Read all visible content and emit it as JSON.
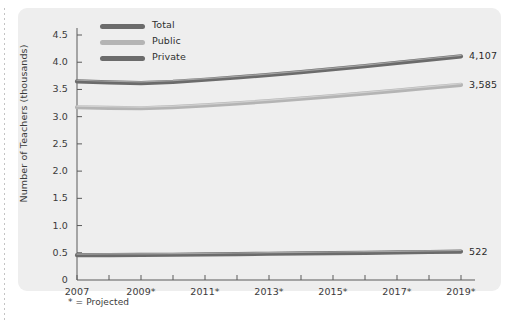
{
  "figure": {
    "background_color": "#eeeeee",
    "footnote": "* = Projected"
  },
  "axes": {
    "ylabel": "Number of Teachers (thousands)",
    "yticks": [
      "0",
      "0.5",
      "1.0",
      "1.5",
      "2.0",
      "2.5",
      "3.0",
      "3.5",
      "4.0",
      "4.5"
    ],
    "xticks": [
      "2007",
      "2009*",
      "2011*",
      "2013*",
      "2015*",
      "2017*",
      "2019*"
    ]
  },
  "legend": [
    {
      "label": "Total",
      "color": "#6b6b6b"
    },
    {
      "label": "Public",
      "color": "#b4b4b4"
    },
    {
      "label": "Private",
      "color": "#6b6b6b"
    }
  ],
  "end_labels": [
    {
      "series": "Total",
      "value": "4,107"
    },
    {
      "series": "Public",
      "value": "3,585"
    },
    {
      "series": "Private",
      "value": "522"
    }
  ],
  "chart_data": {
    "type": "line",
    "title": "",
    "xlabel": "",
    "ylabel": "Number of Teachers (thousands)",
    "xlim": [
      2007,
      2019
    ],
    "ylim": [
      0,
      4.5
    ],
    "grid": false,
    "legend_position": "top-left",
    "note": "* = Projected",
    "x": [
      2007,
      2008,
      2009,
      2010,
      2011,
      2012,
      2013,
      2014,
      2015,
      2016,
      2017,
      2018,
      2019
    ],
    "series": [
      {
        "name": "Total",
        "color": "#6b6b6b",
        "end_label": "4,107",
        "values": [
          3.649,
          3.63,
          3.617,
          3.64,
          3.678,
          3.72,
          3.766,
          3.818,
          3.872,
          3.928,
          3.988,
          4.048,
          4.107
        ]
      },
      {
        "name": "Public",
        "color": "#b4b4b4",
        "end_label": "3,585",
        "values": [
          3.173,
          3.162,
          3.155,
          3.175,
          3.207,
          3.244,
          3.285,
          3.33,
          3.378,
          3.427,
          3.479,
          3.532,
          3.585
        ]
      },
      {
        "name": "Private",
        "color": "#6b6b6b",
        "end_label": "522",
        "values": [
          0.456,
          0.458,
          0.46,
          0.464,
          0.47,
          0.476,
          0.482,
          0.488,
          0.494,
          0.5,
          0.507,
          0.514,
          0.522
        ]
      }
    ]
  }
}
